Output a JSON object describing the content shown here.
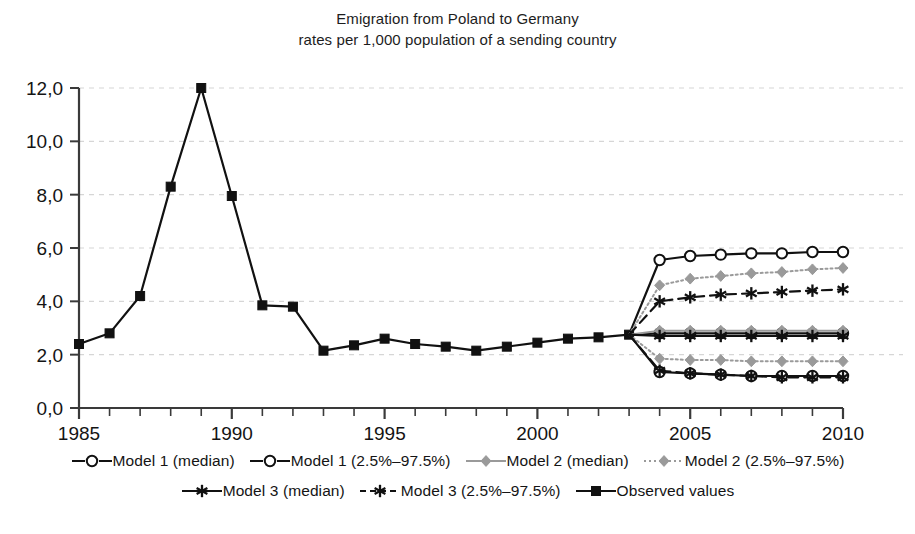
{
  "title": {
    "line1": "Emigration from Poland to Germany",
    "line2": "rates per 1,000 population of a sending country"
  },
  "colors": {
    "observed": "#111111",
    "model1": "#111111",
    "model2": "#9a9a9a",
    "model3": "#111111",
    "grid": "#d6d6d6",
    "axis": "#3a3a3a",
    "background": "#ffffff"
  },
  "legend": {
    "rows": [
      [
        {
          "label": "Model 1 (median)",
          "key": "line-open-circle-solid-black"
        },
        {
          "label": "Model 1 (2.5%–97.5%)",
          "key": "line-open-circle-solid-black"
        },
        {
          "label": "Model 2 (median)",
          "key": "line-diamond-solid-gray"
        },
        {
          "label": "Model 2 (2.5%–97.5%)",
          "key": "line-diamond-dotted-gray"
        }
      ],
      [
        {
          "label": "Model 3 (median)",
          "key": "line-star-solid-black"
        },
        {
          "label": "Model 3 (2.5%–97.5%)",
          "key": "line-star-dashed-black"
        },
        {
          "label": "Observed values",
          "key": "line-square-solid-black"
        }
      ]
    ]
  },
  "chart_data": {
    "type": "line",
    "xlabel": "",
    "ylabel": "",
    "xlim": [
      1985,
      2010
    ],
    "ylim": [
      0.0,
      12.0
    ],
    "ytick_step": 2.0,
    "xtick_step": 1,
    "xtick_labels": [
      "1985",
      "1990",
      "1995",
      "2000",
      "2005",
      "2010"
    ],
    "xtick_label_years": [
      1985,
      1990,
      1995,
      2000,
      2005,
      2010
    ],
    "ytick_labels": [
      "0,0",
      "2,0",
      "4,0",
      "6,0",
      "8,0",
      "10,0",
      "12,0"
    ],
    "ytick_values": [
      0.0,
      2.0,
      4.0,
      6.0,
      8.0,
      10.0,
      12.0
    ],
    "decimal_separator": ",",
    "grid": "horizontal-dashed",
    "legend_position": "bottom",
    "series": [
      {
        "name": "Observed values",
        "marker": "filled-square",
        "line": "solid",
        "color": "#111111",
        "x": [
          1985,
          1986,
          1987,
          1988,
          1989,
          1990,
          1991,
          1992,
          1993,
          1994,
          1995,
          1996,
          1997,
          1998,
          1999,
          2000,
          2001,
          2002,
          2003
        ],
        "values": [
          2.4,
          2.8,
          4.2,
          8.3,
          12.0,
          7.95,
          3.85,
          3.8,
          2.15,
          2.35,
          2.6,
          2.4,
          2.3,
          2.15,
          2.3,
          2.45,
          2.6,
          2.65,
          2.75
        ]
      },
      {
        "name": "Model 1 (median)",
        "marker": "open-circle",
        "line": "solid",
        "color": "#111111",
        "x": [
          2003,
          2004,
          2005,
          2006,
          2007,
          2008,
          2009,
          2010
        ],
        "values": [
          2.75,
          2.8,
          2.8,
          2.8,
          2.8,
          2.8,
          2.8,
          2.8
        ]
      },
      {
        "name": "Model 1 (97.5%)",
        "marker": "open-circle",
        "line": "solid",
        "color": "#111111",
        "x": [
          2003,
          2004,
          2005,
          2006,
          2007,
          2008,
          2009,
          2010
        ],
        "values": [
          2.75,
          5.55,
          5.7,
          5.75,
          5.8,
          5.8,
          5.85,
          5.85
        ]
      },
      {
        "name": "Model 1 (2.5%)",
        "marker": "open-circle",
        "line": "solid",
        "color": "#111111",
        "x": [
          2003,
          2004,
          2005,
          2006,
          2007,
          2008,
          2009,
          2010
        ],
        "values": [
          2.75,
          1.35,
          1.3,
          1.25,
          1.2,
          1.2,
          1.2,
          1.2
        ]
      },
      {
        "name": "Model 2 (median)",
        "marker": "diamond",
        "line": "solid",
        "color": "#9a9a9a",
        "x": [
          2003,
          2004,
          2005,
          2006,
          2007,
          2008,
          2009,
          2010
        ],
        "values": [
          2.75,
          2.9,
          2.9,
          2.9,
          2.9,
          2.9,
          2.9,
          2.9
        ]
      },
      {
        "name": "Model 2 (97.5%)",
        "marker": "diamond",
        "line": "dotted",
        "color": "#9a9a9a",
        "x": [
          2003,
          2004,
          2005,
          2006,
          2007,
          2008,
          2009,
          2010
        ],
        "values": [
          2.75,
          4.6,
          4.85,
          4.95,
          5.05,
          5.1,
          5.2,
          5.25
        ]
      },
      {
        "name": "Model 2 (2.5%)",
        "marker": "diamond",
        "line": "dotted",
        "color": "#9a9a9a",
        "x": [
          2003,
          2004,
          2005,
          2006,
          2007,
          2008,
          2009,
          2010
        ],
        "values": [
          2.75,
          1.85,
          1.8,
          1.8,
          1.75,
          1.75,
          1.75,
          1.75
        ]
      },
      {
        "name": "Model 3 (median)",
        "marker": "star",
        "line": "solid",
        "color": "#111111",
        "x": [
          2003,
          2004,
          2005,
          2006,
          2007,
          2008,
          2009,
          2010
        ],
        "values": [
          2.75,
          2.7,
          2.7,
          2.7,
          2.7,
          2.7,
          2.7,
          2.7
        ]
      },
      {
        "name": "Model 3 (97.5%)",
        "marker": "star",
        "line": "dashed",
        "color": "#111111",
        "x": [
          2003,
          2004,
          2005,
          2006,
          2007,
          2008,
          2009,
          2010
        ],
        "values": [
          2.75,
          4.0,
          4.15,
          4.25,
          4.3,
          4.35,
          4.4,
          4.45
        ]
      },
      {
        "name": "Model 3 (2.5%)",
        "marker": "star",
        "line": "dashed",
        "color": "#111111",
        "x": [
          2003,
          2004,
          2005,
          2006,
          2007,
          2008,
          2009,
          2010
        ],
        "values": [
          2.75,
          1.4,
          1.3,
          1.25,
          1.2,
          1.15,
          1.15,
          1.15
        ]
      }
    ]
  }
}
